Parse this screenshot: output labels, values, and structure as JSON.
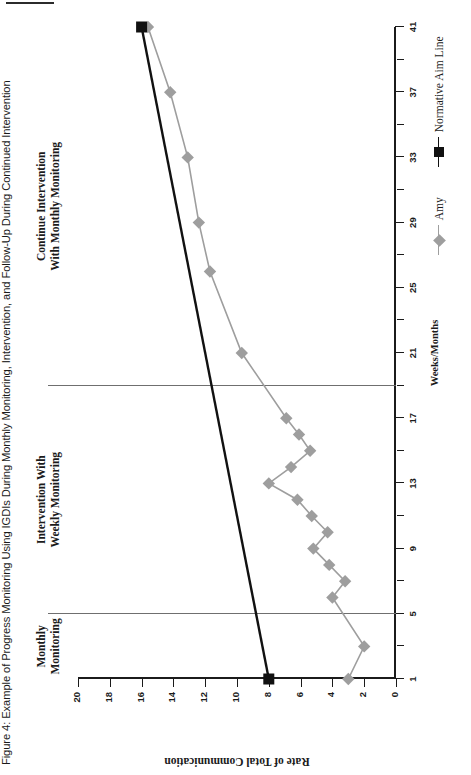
{
  "figure": {
    "title": "Figure 4: Example of Progress Monitoring Using IGDIs During Monthly Monitoring, Intervention, and Follow-Up During Continued Intervention"
  },
  "legend": {
    "items": [
      {
        "label": "Amy",
        "marker": "diamond-marker",
        "color": "#9e9e9e"
      },
      {
        "label": "Normative Aim Line",
        "marker": "square-marker",
        "color": "#111111"
      }
    ]
  },
  "phases": [
    {
      "label_line1": "Monthly",
      "label_line2": "Monitoring",
      "center_week": 3
    },
    {
      "label_line1": "Intervention With",
      "label_line2": "Weekly Monitoring",
      "center_week": 12
    },
    {
      "label_line1": "Continue Intervention",
      "label_line2": "With Monthly Monitoring",
      "center_week": 30
    }
  ],
  "phase_lines": [
    5,
    19
  ],
  "chart_data": {
    "type": "line",
    "title": "Figure 4: Example of Progress Monitoring Using IGDIs During Monthly Monitoring, Intervention, and Follow-Up During Continued Intervention",
    "xlabel": "Weeks/Months",
    "ylabel": "Rate of Total Communication",
    "xlim": [
      1,
      41
    ],
    "ylim": [
      0,
      20
    ],
    "xticks": [
      1,
      5,
      9,
      13,
      17,
      21,
      25,
      29,
      33,
      37,
      41
    ],
    "xtick_minor": [
      3,
      7,
      11,
      15,
      19,
      23,
      27,
      31,
      35,
      39
    ],
    "yticks": [
      0,
      2,
      4,
      6,
      8,
      10,
      12,
      14,
      16,
      18,
      20
    ],
    "grid": false,
    "legend_position": "bottom-right",
    "series": [
      {
        "name": "Amy",
        "color": "#9e9e9e",
        "marker": "diamond",
        "points": [
          {
            "x": 1,
            "y": 3.0
          },
          {
            "x": 3,
            "y": 2.0
          },
          {
            "x": 6,
            "y": 4.0
          },
          {
            "x": 7,
            "y": 3.2
          },
          {
            "x": 8,
            "y": 4.2
          },
          {
            "x": 9,
            "y": 5.2
          },
          {
            "x": 10,
            "y": 4.3
          },
          {
            "x": 11,
            "y": 5.3
          },
          {
            "x": 12,
            "y": 6.2
          },
          {
            "x": 13,
            "y": 8.0
          },
          {
            "x": 14,
            "y": 6.6
          },
          {
            "x": 15,
            "y": 5.4
          },
          {
            "x": 16,
            "y": 6.1
          },
          {
            "x": 17,
            "y": 6.9
          },
          {
            "x": 21,
            "y": 9.7
          },
          {
            "x": 26,
            "y": 11.7
          },
          {
            "x": 29,
            "y": 12.4
          },
          {
            "x": 33,
            "y": 13.1
          },
          {
            "x": 37,
            "y": 14.2
          },
          {
            "x": 41,
            "y": 15.6
          }
        ]
      },
      {
        "name": "Normative Aim Line",
        "color": "#111111",
        "marker": "square",
        "points": [
          {
            "x": 1,
            "y": 8.0
          },
          {
            "x": 41,
            "y": 16.0
          }
        ]
      }
    ]
  }
}
